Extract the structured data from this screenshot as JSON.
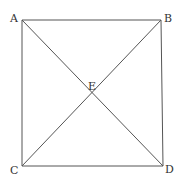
{
  "diagram": {
    "type": "square-with-diagonals",
    "stroke_color": "#555555",
    "label_color": "#333333",
    "points": {
      "A": {
        "label": "A",
        "x": 22,
        "y": 20
      },
      "B": {
        "label": "B",
        "x": 161,
        "y": 20
      },
      "C": {
        "label": "C",
        "x": 22,
        "y": 166
      },
      "D": {
        "label": "D",
        "x": 163,
        "y": 166
      },
      "E": {
        "label": "E",
        "x": 92,
        "y": 93
      }
    },
    "segments": [
      [
        "A",
        "B"
      ],
      [
        "B",
        "D"
      ],
      [
        "D",
        "C"
      ],
      [
        "C",
        "A"
      ],
      [
        "A",
        "D"
      ],
      [
        "C",
        "B"
      ]
    ]
  }
}
